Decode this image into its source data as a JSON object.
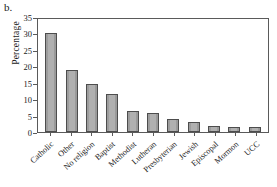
{
  "panel": {
    "label": "b."
  },
  "axes": {
    "ylabel": "Percentage",
    "yticks": [
      "35",
      "30",
      "25",
      "20",
      "15",
      "10",
      "5",
      "0"
    ]
  },
  "chart_data": {
    "type": "bar",
    "title": "",
    "xlabel": "",
    "ylabel": "Percentage",
    "ylim": [
      0,
      35
    ],
    "ytick_step": 5,
    "grid": false,
    "legend": false,
    "bar_color": "#a6a6a6",
    "bar_edge_color": "#4d4d4d",
    "categories": [
      "Catholic",
      "Other",
      "No religion",
      "Baptist",
      "Methodist",
      "Lutheran",
      "Presbyterian",
      "Jewish",
      "Episcopal",
      "Mormon",
      "UCC"
    ],
    "values": [
      30.6,
      19.3,
      15.0,
      11.7,
      6.5,
      5.9,
      4.1,
      3.0,
      1.8,
      1.7,
      1.6
    ]
  }
}
